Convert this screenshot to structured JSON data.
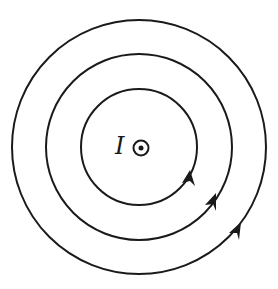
{
  "diagram": {
    "current_label": "I",
    "current_direction": "out-of-page-dot-icon",
    "field_lines": [
      {
        "name": "inner",
        "radius": 58
      },
      {
        "name": "middle",
        "radius": 93
      },
      {
        "name": "outer",
        "radius": 127
      }
    ],
    "arrow_direction": "counterclockwise",
    "stroke_color": "#1a1a1a"
  }
}
